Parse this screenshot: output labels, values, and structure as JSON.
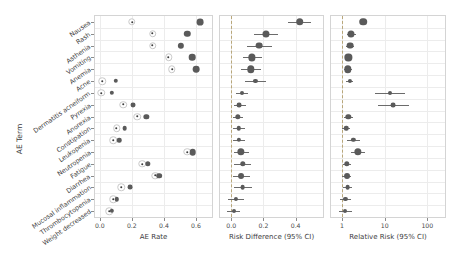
{
  "chart_data": {
    "type": "scatter",
    "title": "",
    "ylabel": "AE Term",
    "categories": [
      "Nausea",
      "Rash",
      "Asthenia",
      "Vomiting",
      "Anemia",
      "Acne",
      "Dermatitis acneiform",
      "Pyrexia",
      "Anorexia",
      "Constipation",
      "Leukopenia",
      "Neutropenia",
      "Fatigue",
      "Diarrhea",
      "Mucosal inflammation",
      "Thrombocytopenia",
      "Weight decreased"
    ],
    "panels": [
      {
        "name": "ae-rate",
        "xlabel": "AE Rate",
        "scale": "linear",
        "xlim": [
          -0.03,
          0.7
        ],
        "ticks": [
          0.0,
          0.2,
          0.4,
          0.6
        ],
        "tick_labels": [
          "0.0",
          "0.2",
          "0.4",
          "0.6"
        ],
        "grid": true,
        "series": [
          {
            "name": "control",
            "marker": "open-circle",
            "values": [
              0.2,
              0.33,
              0.33,
              0.43,
              0.45,
              0.015,
              0.01,
              0.145,
              0.235,
              0.105,
              0.085,
              0.545,
              0.265,
              0.345,
              0.135,
              0.085,
              0.06
            ]
          },
          {
            "name": "treatment",
            "marker": "solid-circle",
            "color": "#5a5a5a",
            "values": [
              0.625,
              0.545,
              0.505,
              0.575,
              0.6,
              0.1,
              0.075,
              0.205,
              0.29,
              0.155,
              0.12,
              0.58,
              0.3,
              0.37,
              0.19,
              0.105,
              0.075
            ]
          }
        ]
      },
      {
        "name": "risk-difference",
        "xlabel": "Risk Difference (95% CI)",
        "scale": "linear",
        "xlim": [
          -0.07,
          0.57
        ],
        "ticks": [
          0.0,
          0.2,
          0.4
        ],
        "tick_labels": [
          "0.0",
          "0.2",
          "0.4"
        ],
        "reference": 0.0,
        "grid": true,
        "estimates": [
          0.425,
          0.215,
          0.175,
          0.13,
          0.12,
          0.15,
          0.065,
          0.05,
          0.04,
          0.045,
          0.045,
          0.06,
          0.07,
          0.06,
          0.07,
          0.03,
          0.015
        ],
        "ci_low": [
          0.355,
          0.14,
          0.1,
          0.075,
          0.06,
          0.085,
          0.03,
          0.015,
          0.01,
          0.01,
          0.01,
          0.015,
          0.02,
          0.01,
          0.015,
          -0.02,
          -0.025
        ],
        "ci_high": [
          0.495,
          0.29,
          0.25,
          0.19,
          0.185,
          0.215,
          0.105,
          0.09,
          0.075,
          0.085,
          0.085,
          0.11,
          0.125,
          0.115,
          0.13,
          0.08,
          0.055
        ]
      },
      {
        "name": "relative-risk",
        "xlabel": "Relative Risk (95% CI)",
        "scale": "log",
        "xlim": [
          0.55,
          260
        ],
        "ticks": [
          1,
          10,
          100
        ],
        "tick_labels": [
          "1",
          "10",
          "100"
        ],
        "reference": 1,
        "grid": true,
        "estimates": [
          3.1,
          1.65,
          1.55,
          1.4,
          1.35,
          1.5,
          13.0,
          16.0,
          1.4,
          1.25,
          1.85,
          2.35,
          1.3,
          1.3,
          1.35,
          1.2,
          1.2
        ],
        "ci_low": [
          2.6,
          1.3,
          1.25,
          1.15,
          1.1,
          1.25,
          6.0,
          7.0,
          1.1,
          1.0,
          1.3,
          1.6,
          1.05,
          1.0,
          1.05,
          0.9,
          0.85
        ],
        "ci_high": [
          3.7,
          2.1,
          1.95,
          1.75,
          1.7,
          1.85,
          30.0,
          38.0,
          1.8,
          1.55,
          2.6,
          3.45,
          1.6,
          1.65,
          1.75,
          1.6,
          1.7
        ]
      }
    ]
  },
  "colors": {
    "marker_solid": "#5a5a5a",
    "marker_open_border": "#c9c9c9",
    "ci_line": "#6b6b6b",
    "grid": "#ececec",
    "panel_border": "#d4d4d4",
    "reference_line": "#b9a77a",
    "text": "#3d3d3d"
  }
}
